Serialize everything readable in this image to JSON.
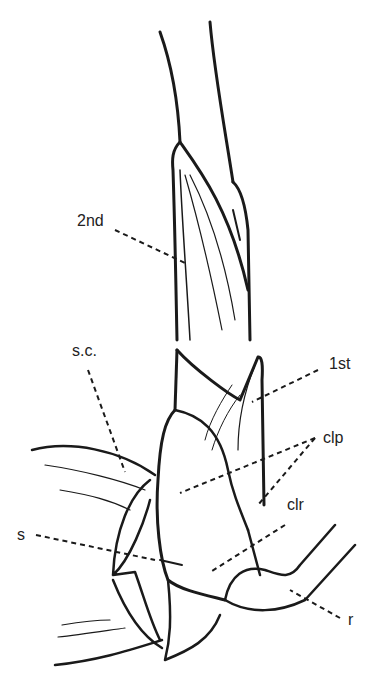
{
  "figure": {
    "type": "botanical line drawing",
    "colors": {
      "ink": "#1a1a1a",
      "background": "#ffffff"
    },
    "labels": [
      {
        "id": "2nd",
        "text": "2nd",
        "x": 77,
        "y": 213
      },
      {
        "id": "1st",
        "text": "1st",
        "x": 329,
        "y": 356
      },
      {
        "id": "clp",
        "text": "clp",
        "x": 323,
        "y": 430
      },
      {
        "id": "clr",
        "text": "clr",
        "x": 287,
        "y": 497
      },
      {
        "id": "s.c.",
        "text": "s.c.",
        "x": 72,
        "y": 343
      },
      {
        "id": "s",
        "text": "s",
        "x": 17,
        "y": 527
      },
      {
        "id": "r",
        "text": "r",
        "x": 348,
        "y": 612
      }
    ]
  }
}
